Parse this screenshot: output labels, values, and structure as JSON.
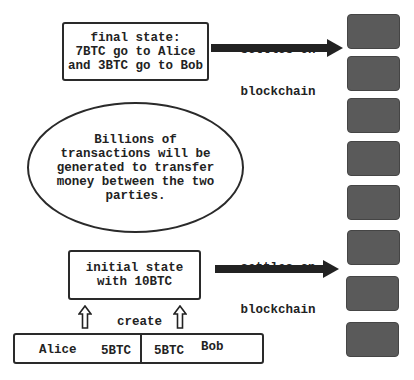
{
  "diagram": {
    "final_state": {
      "lines": [
        "final state:",
        "7BTC go to Alice",
        "and 3BTC go to Bob"
      ]
    },
    "top_arrow": {
      "label_line1": "settles on",
      "label_line2": "blockchain"
    },
    "ellipse": {
      "lines": [
        "Billions of",
        "transactions will be",
        "generated to transfer",
        "money between the two",
        "parties."
      ]
    },
    "bottom_arrow": {
      "label_line1": "settles on",
      "label_line2": "blockchain"
    },
    "initial_state": {
      "lines": [
        "initial state",
        "with 10BTC"
      ]
    },
    "create_label": "create",
    "parties": {
      "alice": {
        "name": "Alice",
        "amount": "5BTC"
      },
      "bob": {
        "name": "Bob",
        "amount": "5BTC"
      }
    },
    "blockchain": {
      "block_count": 8,
      "block_color": "#5a5a5a"
    }
  }
}
